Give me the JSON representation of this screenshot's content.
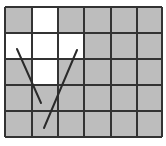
{
  "diagram": {
    "type": "grid-with-lines",
    "rows": 5,
    "cols": 6,
    "origin": [
      5,
      7
    ],
    "col_edges": [
      5,
      32,
      58,
      84,
      111,
      137,
      162
    ],
    "row_edges": [
      7,
      33,
      59,
      85,
      111,
      137
    ],
    "colors": {
      "filled": "#bdbdbd",
      "empty": "#ffffff",
      "border": "#333333",
      "line": "#2a2a2a"
    },
    "white_cells": [
      {
        "row": 0,
        "col": 1
      },
      {
        "row": 1,
        "col": 0
      },
      {
        "row": 1,
        "col": 1
      },
      {
        "row": 1,
        "col": 2
      },
      {
        "row": 2,
        "col": 1
      }
    ],
    "lines": [
      {
        "x1": 17,
        "y1": 49,
        "x2": 41,
        "y2": 103
      },
      {
        "x1": 77,
        "y1": 50,
        "x2": 44,
        "y2": 128
      }
    ]
  }
}
